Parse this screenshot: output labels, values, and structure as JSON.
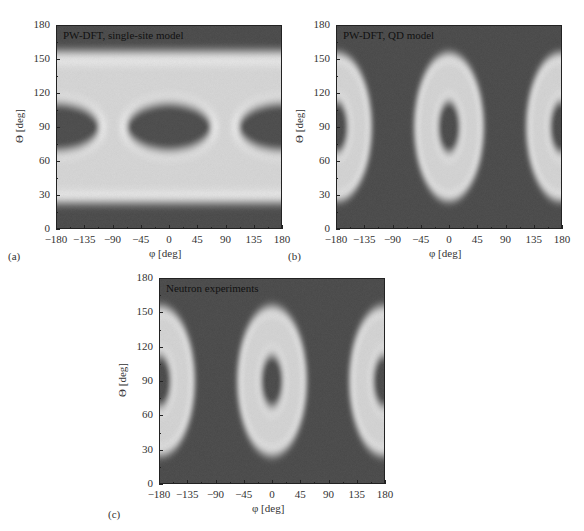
{
  "chart_data": [
    {
      "panel": "(a)",
      "type": "heatmap",
      "title": "PW-DFT, single-site model",
      "xlabel": "φ [deg]",
      "ylabel": "Θ [deg]",
      "xlim": [
        -180,
        180
      ],
      "ylim": [
        0,
        180
      ],
      "xticks": [
        "-180",
        "-135",
        "-90",
        "-45",
        "0",
        "45",
        "90",
        "135",
        "180"
      ],
      "yticks": [
        "0",
        "30",
        "60",
        "90",
        "120",
        "150",
        "180"
      ],
      "description": "Bright horizontal bands at Theta ~25-65 and ~115-155; dark lens-shaped regions centered at (0,90) and (±180,90); dark regions near Theta 0-20 and 160-180",
      "colormap": "grayscale (dark = low, white = high)"
    },
    {
      "panel": "(b)",
      "type": "heatmap",
      "title": "PW-DFT, QD model",
      "xlabel": "φ [deg]",
      "ylabel": "Θ [deg]",
      "xlim": [
        -180,
        180
      ],
      "ylim": [
        0,
        180
      ],
      "xticks": [
        "-180",
        "-135",
        "-90",
        "-45",
        "0",
        "45",
        "90",
        "135",
        "180"
      ],
      "yticks": [
        "0",
        "30",
        "60",
        "90",
        "120",
        "150",
        "180"
      ],
      "description": "Bright elliptical rings centered at (0,90) and (±180,90), outer extent Theta ~25-155, phi half-width ~55; dark core Theta ~65-115",
      "colormap": "grayscale (dark = low, white = high)"
    },
    {
      "panel": "(c)",
      "type": "heatmap",
      "title": "Neutron experiments",
      "xlabel": "φ [deg]",
      "ylabel": "Θ [deg]",
      "xlim": [
        -180,
        180
      ],
      "ylim": [
        0,
        180
      ],
      "xticks": [
        "-180",
        "-135",
        "-90",
        "-45",
        "0",
        "45",
        "90",
        "135",
        "180"
      ],
      "yticks": [
        "0",
        "30",
        "60",
        "90",
        "120",
        "150",
        "180"
      ],
      "description": "Bright elliptical rings centered at (0,90) and (±180,90), outer extent Theta ~25-155, phi half-width ~55; dark core Theta ~65-115",
      "colormap": "grayscale (dark = low, white = high)"
    }
  ],
  "panels": {
    "a": {
      "letter": "(a)",
      "title": "PW-DFT, single-site model"
    },
    "b": {
      "letter": "(b)",
      "title": "PW-DFT, QD model"
    },
    "c": {
      "letter": "(c)",
      "title": "Neutron experiments"
    }
  },
  "axes": {
    "xlabel": "φ [deg]",
    "ylabel": "Θ [deg]",
    "xticks": [
      "−180",
      "−135",
      "−90",
      "−45",
      "0",
      "45",
      "90",
      "135",
      "180"
    ],
    "yticks": [
      "0",
      "30",
      "60",
      "90",
      "120",
      "150",
      "180"
    ]
  },
  "colors": {
    "background_dark": "#4a4a4a",
    "band_bright": "#e8e8e8",
    "ring_peak": "#f4f4f4"
  }
}
